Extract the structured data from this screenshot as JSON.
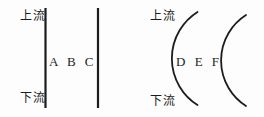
{
  "colors": {
    "background": "#fdfdfd",
    "ink": "#1c1c1c"
  },
  "left_diagram": {
    "upstream_label": "上流",
    "downstream_label": "下流",
    "section_letters": "A B C"
  },
  "right_diagram": {
    "upstream_label": "上流",
    "downstream_label": "下流",
    "section_letters": "D E F"
  }
}
